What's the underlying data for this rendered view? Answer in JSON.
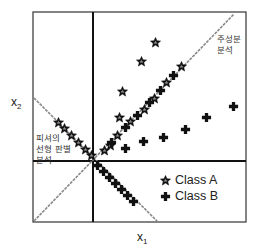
{
  "diagram": {
    "axis_x_label": "x",
    "axis_x_sub": "1",
    "axis_y_label": "x",
    "axis_y_sub": "2",
    "pca_label_line1": "주성분",
    "pca_label_line2": "분석",
    "lda_label_line1": "피셔의",
    "lda_label_line2": "선형 판별",
    "lda_label_line3": "분석",
    "legend": [
      {
        "marker": "star",
        "label": "Class A"
      },
      {
        "marker": "cross",
        "label": "Class B"
      }
    ],
    "colors": {
      "frame": "#222222",
      "pca_line": "#888888",
      "marker": "#111111"
    }
  }
}
